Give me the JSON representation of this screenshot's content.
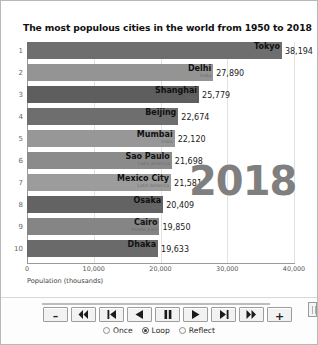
{
  "window": {
    "title": "The most populous cities in the world from 1950 to 2018"
  },
  "chart_data": {
    "type": "bar",
    "orientation": "horizontal",
    "title": "The most populous cities in the world from 1950 to 2018",
    "xlabel": "Population (thousands)",
    "ylabel": "",
    "xlim": [
      0,
      40000
    ],
    "xticks": [
      "0",
      "10,000",
      "20,000",
      "30,000",
      "40,000"
    ],
    "xtick_values": [
      0,
      10000,
      20000,
      30000,
      40000
    ],
    "grid": true,
    "legend": false,
    "annotation": "2018",
    "ranks": [
      "1",
      "2",
      "3",
      "4",
      "5",
      "6",
      "7",
      "8",
      "9",
      "10"
    ],
    "categories": [
      "Tokyo",
      "Delhi",
      "Shanghai",
      "Beijing",
      "Mumbai",
      "Sao Paulo",
      "Mexico City",
      "Osaka",
      "Cairo",
      "Dhaka"
    ],
    "values": [
      38194,
      27890,
      25779,
      22674,
      22120,
      21698,
      21581,
      20409,
      19850,
      19633
    ],
    "value_labels": [
      "38,194",
      "27,890",
      "25,779",
      "22,674",
      "22,120",
      "21,698",
      "21,581",
      "20,409",
      "19,850",
      "19,633"
    ],
    "regions": [
      "Asia",
      "India",
      "Asia",
      "Asia",
      "India",
      "Latin America",
      "Latin America",
      "Asia",
      "Middle East",
      "Asia"
    ],
    "bar_colors": [
      "#6e6e6e",
      "#949494",
      "#5e5e5e",
      "#6e6e6e",
      "#979797",
      "#8b8b8b",
      "#9c9c9c",
      "#636363",
      "#858585",
      "#6a6a6a"
    ]
  },
  "player": {
    "slider": {
      "position_percent": 100
    },
    "buttons": [
      {
        "name": "decrease-speed-button",
        "icon": "minus-icon",
        "glyph": "–"
      },
      {
        "name": "jump-to-start-button",
        "icon": "skip-to-start-icon",
        "glyph": "⏮"
      },
      {
        "name": "step-backward-button",
        "icon": "step-backward-icon",
        "glyph": "⏴▏"
      },
      {
        "name": "play-reverse-button",
        "icon": "play-reverse-icon",
        "glyph": "◀"
      },
      {
        "name": "pause-button",
        "icon": "pause-icon",
        "glyph": "⏸"
      },
      {
        "name": "play-button",
        "icon": "play-icon",
        "glyph": "▶"
      },
      {
        "name": "step-forward-button",
        "icon": "step-forward-icon",
        "glyph": "▏⏵"
      },
      {
        "name": "jump-to-end-button",
        "icon": "skip-to-end-icon",
        "glyph": "⏭"
      },
      {
        "name": "increase-speed-button",
        "icon": "plus-icon",
        "glyph": "+"
      }
    ],
    "modes": [
      {
        "label": "Once",
        "selected": false
      },
      {
        "label": "Loop",
        "selected": true
      },
      {
        "label": "Reflect",
        "selected": false
      }
    ]
  }
}
